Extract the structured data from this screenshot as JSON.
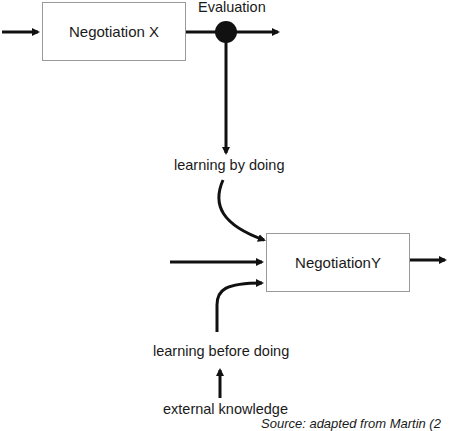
{
  "diagram": {
    "nodes": {
      "negotiation_x": "Negotiation X",
      "negotiation_y": "NegotiationY",
      "evaluation": "Evaluation",
      "learning_by_doing": "learning by doing",
      "learning_before_doing": "learning before doing",
      "external_knowledge": "external knowledge"
    },
    "caption": "Source: adapted from Martin (2",
    "colors": {
      "stroke": "#111111",
      "box_border": "#9a9a9a",
      "text": "#1a1a1a"
    }
  }
}
